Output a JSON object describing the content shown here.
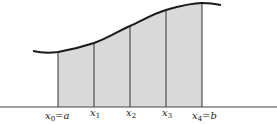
{
  "diagram": {
    "type": "riemann-partition",
    "colors": {
      "fill": "#d9d9d9",
      "curve": "#1a1a1a",
      "lines": "#333333",
      "axis": "#444444"
    },
    "labels": [
      {
        "var": "x",
        "sub": "0",
        "suffix": "=a"
      },
      {
        "var": "x",
        "sub": "1",
        "suffix": ""
      },
      {
        "var": "x",
        "sub": "2",
        "suffix": ""
      },
      {
        "var": "x",
        "sub": "3",
        "suffix": ""
      },
      {
        "var": "x",
        "sub": "4",
        "suffix": "=b"
      }
    ]
  }
}
